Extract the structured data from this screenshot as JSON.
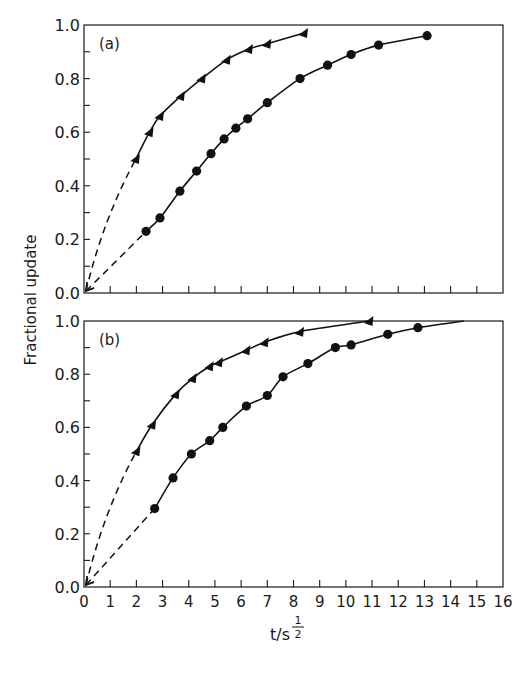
{
  "chart_data": {
    "type": "scatter",
    "title": "",
    "xlabel": "t/s",
    "xlabel_superscript": "1/2",
    "ylabel": "Fractional update",
    "xlim": [
      0,
      16
    ],
    "ylim": [
      0.0,
      1.0
    ],
    "x_ticks": [
      "0",
      "1",
      "2",
      "3",
      "4",
      "5",
      "6",
      "7",
      "8",
      "9",
      "10",
      "11",
      "12",
      "13",
      "14",
      "15",
      "16"
    ],
    "y_ticks": [
      "0.0",
      "0.2",
      "0.4",
      "0.6",
      "0.8",
      "1.0"
    ],
    "grid": false,
    "legend": null,
    "panels": [
      {
        "label": "(a)",
        "series": [
          {
            "name": "triangles",
            "marker": "triangle-left",
            "x": [
              1.98,
              2.5,
              2.9,
              3.7,
              4.5,
              5.45,
              6.3,
              7.0,
              8.4
            ],
            "y": [
              0.5,
              0.6,
              0.66,
              0.735,
              0.8,
              0.87,
              0.91,
              0.93,
              0.97
            ],
            "fit_extrapolation_to_origin": true
          },
          {
            "name": "circles",
            "marker": "circle",
            "x": [
              2.37,
              2.9,
              3.66,
              4.3,
              4.85,
              5.35,
              5.8,
              6.25,
              7.0,
              8.25,
              9.3,
              10.2,
              11.25,
              13.1
            ],
            "y": [
              0.23,
              0.28,
              0.38,
              0.455,
              0.52,
              0.575,
              0.615,
              0.65,
              0.71,
              0.8,
              0.85,
              0.89,
              0.925,
              0.96
            ],
            "fit_extrapolation_to_origin": true
          }
        ]
      },
      {
        "label": "(b)",
        "series": [
          {
            "name": "triangles",
            "marker": "triangle-left",
            "x": [
              2.0,
              2.6,
              3.5,
              4.15,
              4.8,
              5.15,
              6.2,
              6.9,
              8.25,
              10.9
            ],
            "y": [
              0.51,
              0.61,
              0.725,
              0.785,
              0.83,
              0.845,
              0.89,
              0.92,
              0.96,
              1.0
            ],
            "fit_extrapolation_to_origin": true
          },
          {
            "name": "circles",
            "marker": "circle",
            "x": [
              2.7,
              3.4,
              4.1,
              4.8,
              5.3,
              6.2,
              7.0,
              7.6,
              8.55,
              9.6,
              10.2,
              11.6,
              12.75
            ],
            "y": [
              0.295,
              0.41,
              0.5,
              0.55,
              0.6,
              0.68,
              0.72,
              0.79,
              0.84,
              0.9,
              0.91,
              0.95,
              0.975
            ],
            "fit_end": [
              14.5,
              1.0
            ],
            "fit_extrapolation_to_origin": true
          }
        ]
      }
    ]
  },
  "labels": {
    "panel_a": "(a)",
    "panel_b": "(b)",
    "ylabel": "Fractional update",
    "xlabel_main": "t/s",
    "xlabel_sup_num": "1",
    "xlabel_sup_den": "2"
  },
  "colors": {
    "ink": "#111111",
    "background": "#ffffff"
  }
}
